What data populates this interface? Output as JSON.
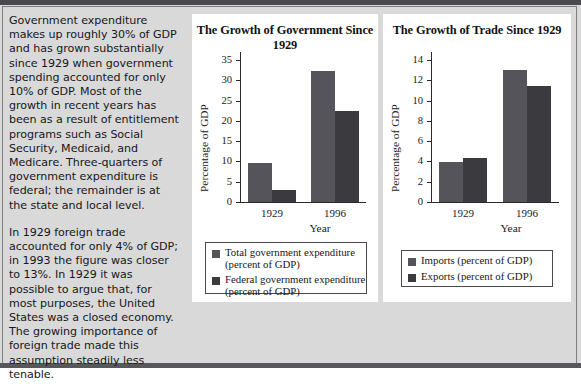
{
  "article": {
    "paragraphs": [
      "Government expenditure makes up roughly 30% of GDP and has grown substantially since 1929 when government spending accounted for only 10% of GDP. Most of the growth in recent years has been as a result of entitlement programs such as Social Security, Medicaid, and Medicare. Three-quarters of government expenditure is federal; the remainder is at the state and local level.",
      "In 1929 foreign trade accounted for only 4% of GDP; in 1993 the figure was closer to 13%. In 1929 it was possible to argue that, for most purposes, the United States was a closed economy. The growing importance of foreign trade made this assumption steadily less tenable."
    ]
  },
  "colors": {
    "series_light": "#55545a",
    "series_dark": "#3a3a3f",
    "page_background": "#d9d9d9",
    "panel_background": "#ffffff",
    "rule": "#4a4a4c"
  },
  "chart_data": [
    {
      "type": "bar",
      "title": "The Growth of Government  Since 1929",
      "xlabel": "Year",
      "ylabel": "Percentage of GDP",
      "categories": [
        "1929",
        "1996"
      ],
      "ylim": [
        0,
        37
      ],
      "yticks": [
        0,
        5,
        10,
        15,
        20,
        25,
        30,
        35
      ],
      "grid": false,
      "legend_position": "below",
      "series": [
        {
          "name": "Total government expenditure (percent of GDP)",
          "legend_line1": "Total government expenditure",
          "legend_line2": "(percent of GDP)",
          "color": "#55545a",
          "values": [
            9.7,
            32.3
          ]
        },
        {
          "name": "Federal government expenditure (percent of GDP)",
          "legend_line1": "Federal government expenditure",
          "legend_line2": "(percent of GDP)",
          "color": "#3a3a3f",
          "values": [
            3.0,
            22.5
          ]
        }
      ]
    },
    {
      "type": "bar",
      "title": "The Growth of Trade Since 1929",
      "xlabel": "Year",
      "ylabel": "Percentage of GDP",
      "categories": [
        "1929",
        "1996"
      ],
      "ylim": [
        0,
        14.8
      ],
      "yticks": [
        0,
        2,
        4,
        6,
        8,
        10,
        12,
        14
      ],
      "grid": false,
      "legend_position": "below",
      "series": [
        {
          "name": "Imports (percent of GDP)",
          "legend_line1": "Imports (percent of GDP)",
          "legend_line2": "",
          "color": "#55545a",
          "values": [
            3.9,
            13.0
          ]
        },
        {
          "name": "Exports (percent of GDP)",
          "legend_line1": "Exports (percent of GDP)",
          "legend_line2": "",
          "color": "#3a3a3f",
          "values": [
            4.3,
            11.4
          ]
        }
      ]
    }
  ]
}
